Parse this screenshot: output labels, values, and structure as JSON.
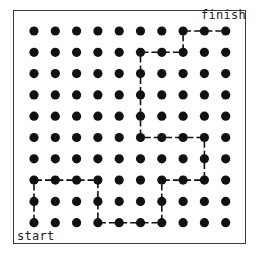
{
  "labels": {
    "start": "start",
    "finish": "finish"
  },
  "grid": {
    "columns": 10,
    "rows": 10,
    "origin_x": 34,
    "origin_y": 31,
    "spacing": 21.3,
    "dot_radius": 4.6,
    "dot_color": "#111111"
  },
  "path": {
    "color": "#111111",
    "points": [
      [
        0,
        9
      ],
      [
        0,
        8
      ],
      [
        0,
        7
      ],
      [
        1,
        7
      ],
      [
        2,
        7
      ],
      [
        3,
        7
      ],
      [
        3,
        8
      ],
      [
        3,
        9
      ],
      [
        4,
        9
      ],
      [
        5,
        9
      ],
      [
        6,
        9
      ],
      [
        6,
        8
      ],
      [
        6,
        7
      ],
      [
        7,
        7
      ],
      [
        8,
        7
      ],
      [
        8,
        6
      ],
      [
        8,
        5
      ],
      [
        7,
        5
      ],
      [
        6,
        5
      ],
      [
        5,
        5
      ],
      [
        5,
        4
      ],
      [
        5,
        3
      ],
      [
        5,
        2
      ],
      [
        5,
        1
      ],
      [
        6,
        1
      ],
      [
        7,
        1
      ],
      [
        7,
        0
      ],
      [
        8,
        0
      ],
      [
        9,
        0
      ]
    ]
  }
}
